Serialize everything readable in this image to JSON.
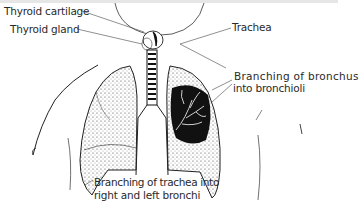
{
  "diagram": {
    "labels": {
      "thyroid_cartilage": "Thyroid cartilage",
      "thyroid_gland": "Thyroid gland",
      "trachea": "Trachea",
      "bronchus_line1": "Branching of bronchus",
      "bronchus_line2": "into bronchioli",
      "trachea_branch_line1": "Branching of trachea into",
      "trachea_branch_line2": "right and left bronchi"
    },
    "colors": {
      "ink": "#1a1a1a",
      "label_text": "#2a2a2a",
      "background": "#ffffff"
    }
  }
}
